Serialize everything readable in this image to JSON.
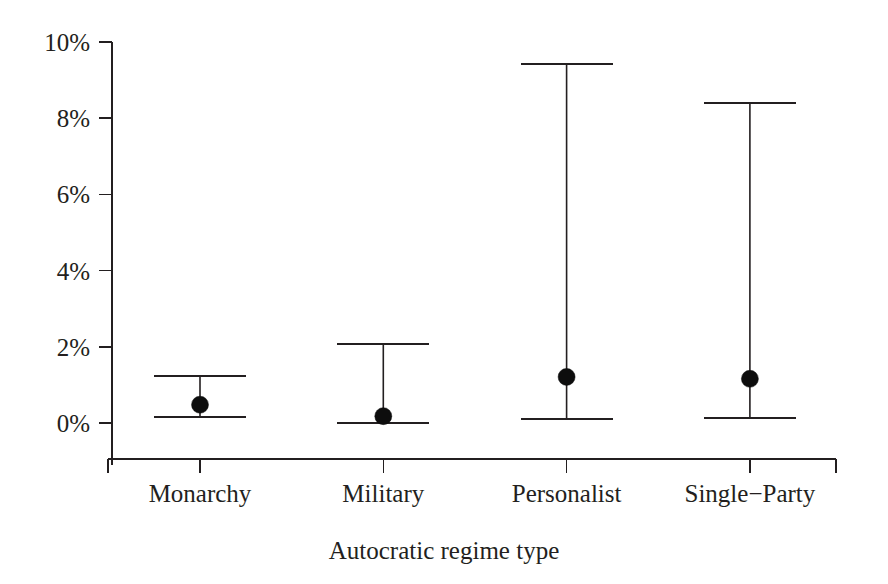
{
  "chart_data": {
    "type": "scatter",
    "title": "",
    "subtitle": "",
    "xlabel": "Autocratic regime type",
    "ylabel": "",
    "categories": [
      "Monarchy",
      "Military",
      "Personalist",
      "Single−Party"
    ],
    "values": [
      0.48,
      0.18,
      1.21,
      1.16
    ],
    "error_low": [
      0.15,
      -0.01,
      0.11,
      0.13
    ],
    "error_high": [
      1.23,
      2.07,
      9.42,
      8.4
    ],
    "series": [
      {
        "name": "Point estimate with 95% interval",
        "points": [
          {
            "category": "Monarchy",
            "value": 0.48,
            "low": 0.15,
            "high": 1.23
          },
          {
            "category": "Military",
            "value": 0.18,
            "low": -0.01,
            "high": 2.07
          },
          {
            "category": "Personalist",
            "value": 1.21,
            "low": 0.11,
            "high": 9.42
          },
          {
            "category": "Single−Party",
            "value": 1.16,
            "low": 0.13,
            "high": 8.4
          }
        ]
      }
    ],
    "ytick_values": [
      0,
      2,
      4,
      6,
      8,
      10
    ],
    "ytick_labels": [
      "0%",
      "2%",
      "4%",
      "6%",
      "8%",
      "10%"
    ],
    "ylim": [
      -0.45,
      10.2
    ],
    "xlim": [
      0,
      5
    ],
    "grid": false,
    "legend": null,
    "legend_position": "none",
    "marker": "filled-circle",
    "line_color": "#231f20",
    "marker_color": "#0d0d0d",
    "background_color": "#ffffff"
  },
  "axes": {
    "y_axis_name": "percentage-axis",
    "x_axis_name": "regime-type-axis"
  }
}
